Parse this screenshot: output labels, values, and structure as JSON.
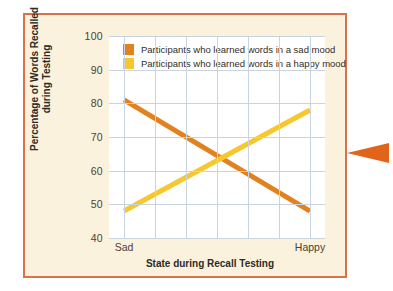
{
  "figure": {
    "frame_color": "#d9714a",
    "background_color": "#fbf2de",
    "plot_background": "#ffffff",
    "gridline_color": "#c9d4de"
  },
  "pointer": {
    "icon": "triangle-left-icon",
    "color": "#e2641b"
  },
  "chart_data": {
    "type": "line",
    "title": "",
    "xlabel": "State during Recall Testing",
    "ylabel": "Percentage of Words Recalled during Testing",
    "ylabel_line1": "Percentage of Words Recalled",
    "ylabel_line2": "during Testing",
    "categories": [
      "Sad",
      "Happy"
    ],
    "x_tick_labels": [
      "Sad",
      "Happy"
    ],
    "y_tick_labels": [
      "100",
      "90",
      "80",
      "70",
      "60",
      "50",
      "40"
    ],
    "y_ticks": [
      100,
      90,
      80,
      70,
      60,
      50,
      40
    ],
    "ylim": [
      40,
      100
    ],
    "grid": true,
    "legend_position": "top-left",
    "series": [
      {
        "name": "Participants who learned words in a sad mood",
        "color": "#e2821e",
        "values": [
          81,
          48
        ]
      },
      {
        "name": "Participants who learned words in a happy mood",
        "color": "#f7c730",
        "values": [
          48,
          78
        ]
      }
    ],
    "annotations": []
  }
}
